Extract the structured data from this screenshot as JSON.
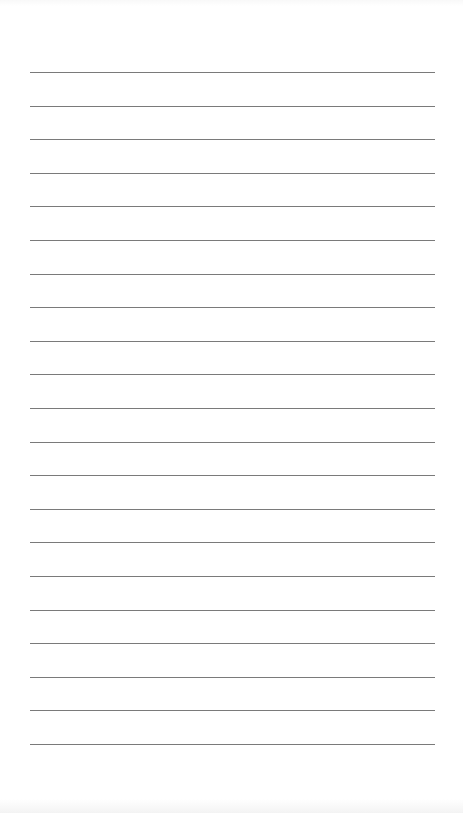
{
  "page": {
    "type": "lined-writing-sheet",
    "background_color": "#ffffff",
    "rule_color": "#7a7a7a",
    "rule_count": 21,
    "rule_left_px": 30,
    "rule_right_px": 435,
    "first_rule_top_px": 72,
    "rule_spacing_px": 33.6,
    "content": ""
  }
}
